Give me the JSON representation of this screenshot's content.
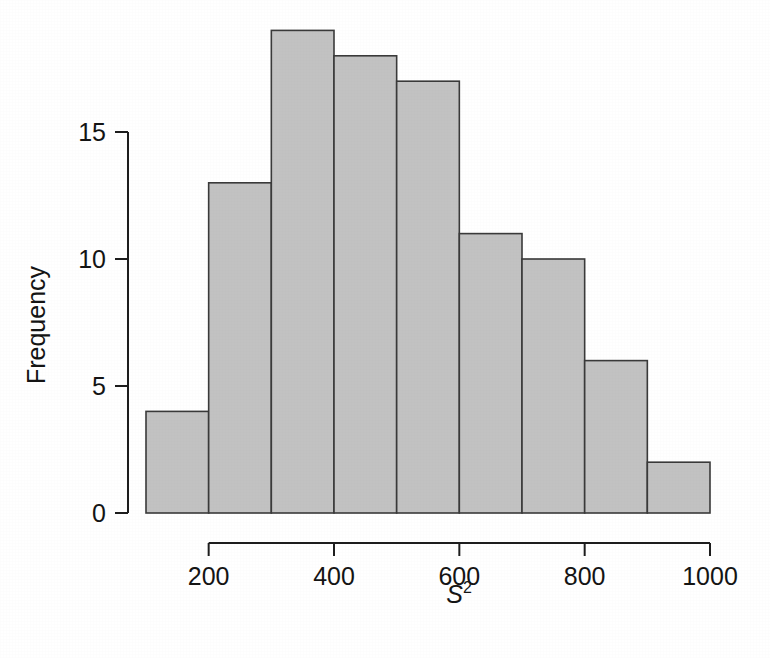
{
  "chart_data": {
    "type": "bar",
    "title": "",
    "subtitle": "",
    "xlabel": "S",
    "xlabel_superscript": "2",
    "ylabel": "Frequency",
    "grid": false,
    "legend": null,
    "xlim": [
      100,
      1000
    ],
    "ylim": [
      0,
      19
    ],
    "bin_width": 100,
    "bin_edges": [
      100,
      200,
      300,
      400,
      500,
      600,
      700,
      800,
      900,
      1000
    ],
    "categories": [
      "100-200",
      "200-300",
      "300-400",
      "400-500",
      "500-600",
      "600-700",
      "700-800",
      "800-900",
      "900-1000"
    ],
    "values": [
      4,
      13,
      19,
      18,
      17,
      11,
      10,
      6,
      2
    ],
    "x_ticks": [
      200,
      400,
      600,
      800,
      1000
    ],
    "x_tick_labels": [
      "200",
      "400",
      "600",
      "800",
      "1000"
    ],
    "y_ticks": [
      0,
      5,
      10,
      15
    ],
    "y_tick_labels": [
      "0",
      "5",
      "10",
      "15"
    ],
    "bar_fill_color": "#c2c2c2",
    "bar_edge_color": "#3a3a3a",
    "axis_color": "#1d1d1d",
    "background_color": "#ffffff"
  },
  "axes": {
    "y_axis_label": "Frequency",
    "x_axis_label_base": "S",
    "x_axis_label_exponent": "2"
  },
  "ticks": {
    "y": [
      {
        "value": 15,
        "label": "15"
      },
      {
        "value": 10,
        "label": "10"
      },
      {
        "value": 5,
        "label": "5"
      },
      {
        "value": 0,
        "label": "0"
      }
    ],
    "x": [
      {
        "value": 200,
        "label": "200"
      },
      {
        "value": 400,
        "label": "400"
      },
      {
        "value": 600,
        "label": "600"
      },
      {
        "value": 800,
        "label": "800"
      },
      {
        "value": 1000,
        "label": "1000"
      }
    ]
  },
  "bars": [
    {
      "bin": "100-200",
      "frequency": 4
    },
    {
      "bin": "200-300",
      "frequency": 13
    },
    {
      "bin": "300-400",
      "frequency": 19
    },
    {
      "bin": "400-500",
      "frequency": 18
    },
    {
      "bin": "500-600",
      "frequency": 17
    },
    {
      "bin": "600-700",
      "frequency": 11
    },
    {
      "bin": "700-800",
      "frequency": 10
    },
    {
      "bin": "800-900",
      "frequency": 6
    },
    {
      "bin": "900-1000",
      "frequency": 2
    }
  ]
}
